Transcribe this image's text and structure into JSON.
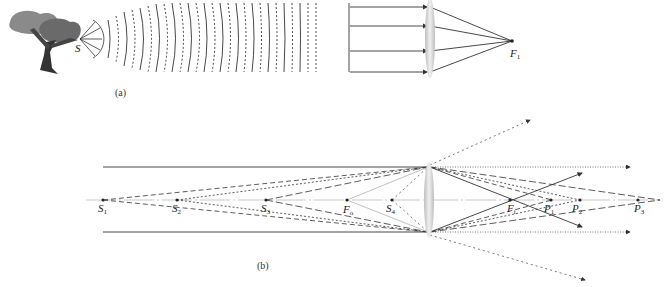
{
  "figure_a": {
    "caption": "(a)",
    "source_label": "S",
    "focus_label": "F",
    "focus_sub": "1",
    "description": "Point source S near a tree emits spherical wavefronts that become plane waves; parallel rays pass through a converging lens and meet at focal point F1"
  },
  "figure_b": {
    "caption": "(b)",
    "source_labels": [
      {
        "main": "S",
        "sub": "1"
      },
      {
        "main": "S",
        "sub": "2"
      },
      {
        "main": "S",
        "sub": "3"
      },
      {
        "main": "S",
        "sub": "4"
      }
    ],
    "focal_labels": [
      {
        "main": "F",
        "sub": "o"
      },
      {
        "main": "F",
        "sub": "i"
      }
    ],
    "image_labels": [
      {
        "main": "P",
        "sub": "1"
      },
      {
        "main": "P",
        "sub": "2"
      },
      {
        "main": "P",
        "sub": "3"
      }
    ],
    "description": "Converging lens on an optical axis with object points S1..S4 and focal points Fo, Fi; image points P1, P2, P3 formed to the right"
  },
  "colors": {
    "ray": "#333333",
    "lens": "#c8c8c8",
    "tree_dark": "#5a5a5a",
    "tree_light": "#8a8a8a"
  }
}
